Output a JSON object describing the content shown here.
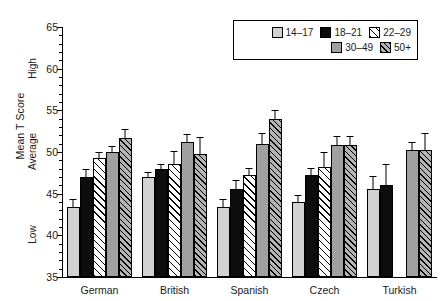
{
  "chart_data": {
    "type": "bar",
    "title": "",
    "xlabel": "",
    "ylabel": "Mean T Score",
    "ylim": [
      35,
      65
    ],
    "ytick_step": 5,
    "yticks": [
      35,
      40,
      45,
      50,
      55,
      60,
      65
    ],
    "ytick_labels": [
      "35",
      "40",
      "45",
      "50",
      "55",
      "60",
      "65"
    ],
    "y_qualitative_labels": [
      {
        "label": "High",
        "value": 60
      },
      {
        "label": "Average",
        "value": 50
      },
      {
        "label": "Low",
        "value": 40
      }
    ],
    "grid": false,
    "legend_position": "top-right",
    "categories": [
      "German",
      "British",
      "Spanish",
      "Czech",
      "Turkish"
    ],
    "series": [
      {
        "name": "14–17",
        "fill": "fill-lightgray",
        "values": [
          43.4,
          47.0,
          43.4,
          44.0,
          45.6
        ],
        "errors": [
          0.9,
          0.5,
          0.9,
          0.7,
          1.4
        ]
      },
      {
        "name": "18–21",
        "fill": "fill-black",
        "values": [
          47.0,
          48.0,
          45.6,
          47.2,
          46.0
        ],
        "errors": [
          0.9,
          0.5,
          0.9,
          0.8,
          2.4
        ]
      },
      {
        "name": "22–29",
        "fill": "fill-hatch-white",
        "values": [
          49.3,
          48.6,
          47.2,
          48.2,
          null
        ],
        "errors": [
          0.6,
          1.4,
          0.8,
          1.7,
          null
        ]
      },
      {
        "name": "30–49",
        "fill": "fill-midgray",
        "values": [
          50.0,
          51.2,
          51.0,
          50.8,
          50.2
        ],
        "errors": [
          0.6,
          0.9,
          1.2,
          1.0,
          0.9
        ]
      },
      {
        "name": "50+",
        "fill": "fill-hatch-gray",
        "values": [
          51.7,
          49.8,
          54.0,
          50.8,
          50.2
        ],
        "errors": [
          0.9,
          1.9,
          0.9,
          1.0,
          2.0
        ]
      }
    ]
  }
}
